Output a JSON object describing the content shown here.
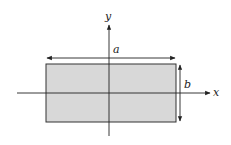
{
  "diagram": {
    "type": "rectangle-cross-section",
    "labels": {
      "x_axis": "x",
      "y_axis": "y",
      "width": "a",
      "height": "b"
    },
    "colors": {
      "fill": "#d8d8d8",
      "stroke": "#333333",
      "background": "#ffffff"
    }
  }
}
